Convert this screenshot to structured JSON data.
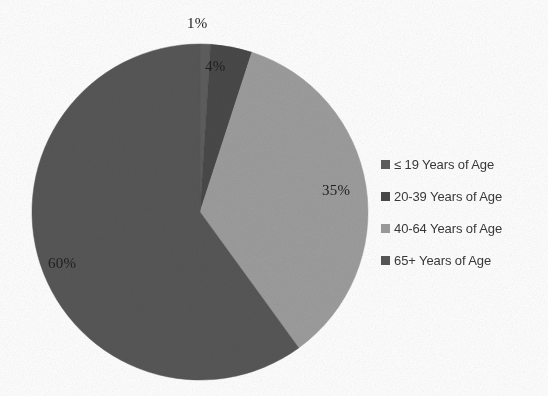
{
  "chart_data": {
    "type": "pie",
    "title": "",
    "categories": [
      "≤ 19 Years of Age",
      "20-39 Years of Age",
      "40-64 Years of Age",
      "65+ Years of Age"
    ],
    "values": [
      1,
      4,
      35,
      60
    ],
    "value_labels": [
      "1%",
      "4%",
      "35%",
      "60%"
    ],
    "units": "percent",
    "colors": [
      "#5e5e5e",
      "#494949",
      "#9d9d9d",
      "#575757"
    ],
    "label_positions": [
      "outside",
      "inside",
      "inside",
      "inside"
    ],
    "start_angle_deg": 0,
    "direction": "clockwise",
    "legend_position": "right",
    "grid": false
  },
  "legend": {
    "items": [
      {
        "label": "≤ 19 Years of Age",
        "color": "#5e5e5e"
      },
      {
        "label": "20-39 Years of Age",
        "color": "#494949"
      },
      {
        "label": "40-64 Years of Age",
        "color": "#9d9d9d"
      },
      {
        "label": "65+ Years of Age",
        "color": "#575757"
      }
    ]
  },
  "labels": {
    "pct_0": "1%",
    "pct_1": "4%",
    "pct_2": "35%",
    "pct_3": "60%"
  }
}
